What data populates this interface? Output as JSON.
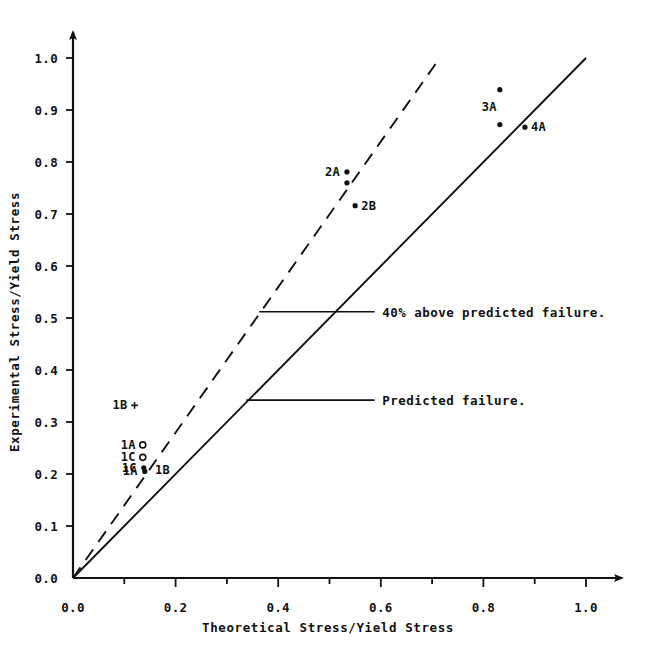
{
  "chart_data": {
    "type": "scatter",
    "title": "",
    "xlabel": "Theoretical Stress/Yield Stress",
    "ylabel": "Experimental Stress/Yield Stress",
    "xlim": [
      0.0,
      1.0
    ],
    "ylim": [
      0.0,
      1.0
    ],
    "grid": false,
    "legend_position": "none",
    "xticks": [
      "0.0",
      "0.2",
      "0.4",
      "0.6",
      "0.8",
      "1.0"
    ],
    "xtick_values": [
      0.0,
      0.2,
      0.4,
      0.6,
      0.8,
      1.0
    ],
    "xminor_step": 0.1,
    "yticks": [
      "0.0",
      "0.1",
      "0.2",
      "0.3",
      "0.4",
      "0.5",
      "0.6",
      "0.7",
      "0.8",
      "0.9",
      "1.0"
    ],
    "ytick_values": [
      0.0,
      0.1,
      0.2,
      0.3,
      0.4,
      0.5,
      0.6,
      0.7,
      0.8,
      0.9,
      1.0
    ],
    "points": [
      {
        "label": "1B",
        "x": 0.12,
        "y": 0.332,
        "marker": "plus",
        "label_side": "left"
      },
      {
        "label": "1A",
        "x": 0.136,
        "y": 0.256,
        "marker": "open-circle",
        "label_side": "left"
      },
      {
        "label": "1C",
        "x": 0.136,
        "y": 0.232,
        "marker": "open-circle",
        "label_side": "left"
      },
      {
        "label": "1C",
        "x": 0.138,
        "y": 0.212,
        "marker": "filled-circle",
        "label_side": "left"
      },
      {
        "label": "1A",
        "x": 0.14,
        "y": 0.205,
        "marker": "filled-circle",
        "label_side": "left"
      },
      {
        "label": "1B",
        "x": 0.148,
        "y": 0.208,
        "marker": "none",
        "label_side": "right"
      },
      {
        "label": "2A",
        "x": 0.534,
        "y": 0.781,
        "marker": "filled-circle",
        "label_side": "left"
      },
      {
        "label": "",
        "x": 0.534,
        "y": 0.76,
        "marker": "filled-circle",
        "label_side": "none"
      },
      {
        "label": "2B",
        "x": 0.55,
        "y": 0.716,
        "marker": "filled-circle",
        "label_side": "right"
      },
      {
        "label": "3A",
        "x": 0.832,
        "y": 0.939,
        "marker": "filled-circle",
        "label_side": "below"
      },
      {
        "label": "",
        "x": 0.832,
        "y": 0.872,
        "marker": "filled-circle",
        "label_side": "none"
      },
      {
        "label": "4A",
        "x": 0.881,
        "y": 0.867,
        "marker": "filled-circle",
        "label_side": "right"
      }
    ],
    "reference_lines": [
      {
        "name": "predicted-failure",
        "style": "solid",
        "slope": 1.0,
        "from": [
          0.0,
          0.0
        ],
        "to": [
          1.0,
          1.0
        ],
        "label": "Predicted failure."
      },
      {
        "name": "40-percent-above-predicted-failure",
        "style": "dashed",
        "slope": 1.4,
        "from": [
          0.0,
          0.0
        ],
        "to": [
          0.715,
          1.0
        ],
        "label": "40% above predicted failure."
      }
    ],
    "annotations": [
      {
        "name": "upper-annotation",
        "text": "40% above predicted failure.",
        "text_x": 0.603,
        "text_y": 0.512,
        "leader_from_x": 0.363,
        "leader_from_y": 0.512,
        "leader_to_x": 0.588,
        "leader_to_y": 0.512
      },
      {
        "name": "lower-annotation",
        "text": "Predicted failure.",
        "text_x": 0.603,
        "text_y": 0.342,
        "leader_from_x": 0.338,
        "leader_from_y": 0.342,
        "leader_to_x": 0.588,
        "leader_to_y": 0.342
      }
    ]
  }
}
